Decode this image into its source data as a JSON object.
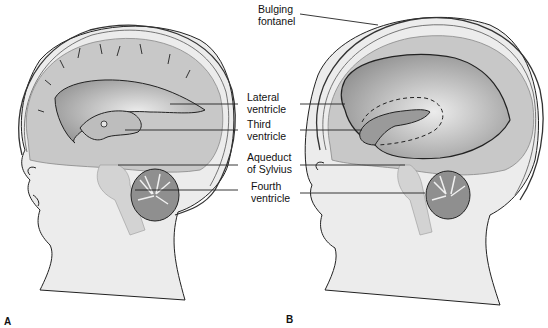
{
  "figure": {
    "panels": [
      {
        "id": "A",
        "label": "A",
        "description": "Normal infant head, sagittal section"
      },
      {
        "id": "B",
        "label": "B",
        "description": "Infant head with hydrocephalus, enlarged ventricles"
      }
    ],
    "labels": {
      "bulging_fontanel": [
        "Bulging",
        "fontanel"
      ],
      "lateral_ventricle": [
        "Lateral",
        "ventricle"
      ],
      "third_ventricle": [
        "Third",
        "ventricle"
      ],
      "aqueduct_of_sylvius": [
        "Aqueduct",
        "of Sylvius"
      ],
      "fourth_ventricle": [
        "Fourth",
        "ventricle"
      ]
    },
    "colors": {
      "skin": "#ececec",
      "brain": "#c8c8c8",
      "ventricle": "#a9a9a9",
      "cerebellum": "#8f8f8f",
      "outline": "#222222",
      "csf": "#dedede"
    }
  }
}
